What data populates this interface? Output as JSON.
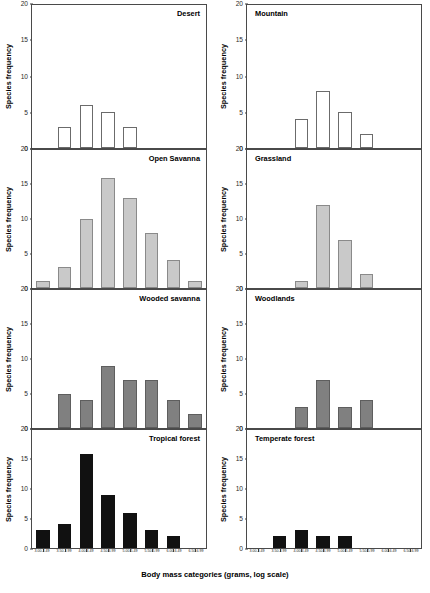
{
  "figure": {
    "xaxis_title": "Body mass categories (grams, log scale)",
    "yaxis_title": "Species frequency"
  },
  "chart_data": {
    "type": "bar",
    "title": "",
    "xlabel": "Body mass categories (grams, log scale)",
    "ylabel": "Species frequency",
    "ylim": [
      0,
      20
    ],
    "yticks": [
      0,
      5,
      10,
      15,
      20
    ],
    "grid": false,
    "legend": "none",
    "layout": "2 columns x 4 rows of small-multiple histograms",
    "categories": [
      "3.00-3.49",
      "3.50-3.99",
      "4.00-4.49",
      "4.50-4.99",
      "5.00-5.49",
      "5.50-5.99",
      "6.00-6.49",
      "6.50-6.99"
    ],
    "panels": [
      {
        "name": "Desert",
        "title_align": "right",
        "bar_style": "open",
        "values": [
          0,
          3,
          6,
          5,
          3,
          0,
          0,
          0
        ]
      },
      {
        "name": "Mountain",
        "title_align": "left",
        "bar_style": "open",
        "values": [
          0,
          0,
          4,
          8,
          5,
          2,
          0,
          0
        ]
      },
      {
        "name": "Open Savanna",
        "title_align": "right",
        "bar_style": "light",
        "values": [
          1,
          3,
          10,
          16,
          13,
          8,
          4,
          1
        ]
      },
      {
        "name": "Grassland",
        "title_align": "left",
        "bar_style": "light",
        "values": [
          0,
          0,
          1,
          12,
          7,
          2,
          0,
          0
        ]
      },
      {
        "name": "Wooded savanna",
        "title_align": "right",
        "bar_style": "dark",
        "values": [
          0,
          5,
          4,
          9,
          7,
          7,
          4,
          2
        ]
      },
      {
        "name": "Woodlands",
        "title_align": "left",
        "bar_style": "dark",
        "values": [
          0,
          0,
          3,
          7,
          3,
          4,
          0,
          0
        ]
      },
      {
        "name": "Tropical forest",
        "title_align": "right",
        "bar_style": "black",
        "values": [
          3,
          4,
          16,
          9,
          6,
          3,
          2,
          0
        ]
      },
      {
        "name": "Temperate forest",
        "title_align": "left",
        "bar_style": "black",
        "values": [
          0,
          2,
          3,
          2,
          2,
          0,
          0,
          0
        ]
      }
    ]
  }
}
